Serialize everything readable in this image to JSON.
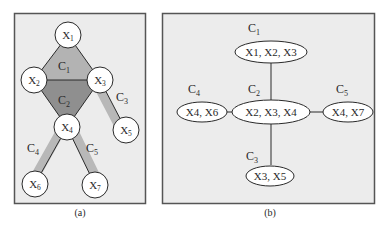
{
  "colors": {
    "panel_bg": "#ececec",
    "panel_border": "#555555",
    "clique_c1_fill": "#b3b3b3",
    "clique_c2_fill": "#8f8f8f",
    "clique_edge_shade": "#b8b8b8",
    "node_fill": "#ffffff",
    "stroke": "#2a2a2a"
  },
  "panel_a": {
    "caption": "(a)",
    "nodes": [
      {
        "id": "X1",
        "base": "X",
        "sub": "1"
      },
      {
        "id": "X2",
        "base": "X",
        "sub": "2"
      },
      {
        "id": "X3",
        "base": "X",
        "sub": "3"
      },
      {
        "id": "X4",
        "base": "X",
        "sub": "4"
      },
      {
        "id": "X5",
        "base": "X",
        "sub": "5"
      },
      {
        "id": "X6",
        "base": "X",
        "sub": "6"
      },
      {
        "id": "X7",
        "base": "X",
        "sub": "7"
      }
    ],
    "edges": [
      [
        "X1",
        "X2"
      ],
      [
        "X1",
        "X3"
      ],
      [
        "X2",
        "X3"
      ],
      [
        "X2",
        "X4"
      ],
      [
        "X3",
        "X4"
      ],
      [
        "X3",
        "X5"
      ],
      [
        "X4",
        "X6"
      ],
      [
        "X4",
        "X7"
      ]
    ],
    "cliques": [
      {
        "id": "C1",
        "base": "C",
        "sub": "1",
        "members": [
          "X1",
          "X2",
          "X3"
        ]
      },
      {
        "id": "C2",
        "base": "C",
        "sub": "2",
        "members": [
          "X2",
          "X3",
          "X4"
        ]
      },
      {
        "id": "C3",
        "base": "C",
        "sub": "3",
        "members": [
          "X3",
          "X5"
        ]
      },
      {
        "id": "C4",
        "base": "C",
        "sub": "4",
        "members": [
          "X4",
          "X6"
        ]
      },
      {
        "id": "C5",
        "base": "C",
        "sub": "5",
        "members": [
          "X4",
          "X7"
        ]
      }
    ]
  },
  "panel_b": {
    "caption": "(b)",
    "cliques": [
      {
        "id": "C1",
        "base": "C",
        "sub": "1",
        "contents": "X1, X2, X3"
      },
      {
        "id": "C2",
        "base": "C",
        "sub": "2",
        "contents": "X2, X3, X4"
      },
      {
        "id": "C3",
        "base": "C",
        "sub": "3",
        "contents": "X3, X5"
      },
      {
        "id": "C4",
        "base": "C",
        "sub": "4",
        "contents": "X4, X6"
      },
      {
        "id": "C5",
        "base": "C",
        "sub": "5",
        "contents": "X4, X7"
      }
    ],
    "edges": [
      [
        "C1",
        "C2"
      ],
      [
        "C2",
        "C3"
      ],
      [
        "C2",
        "C4"
      ],
      [
        "C2",
        "C5"
      ]
    ]
  }
}
